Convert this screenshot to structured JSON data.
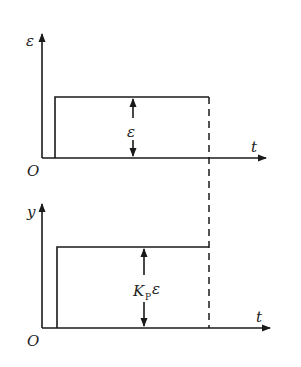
{
  "diagram": {
    "top_plot": {
      "y_axis_label": "ε",
      "x_axis_label": "t",
      "origin_label": "O",
      "amplitude_label": "ε"
    },
    "bottom_plot": {
      "y_axis_label": "y",
      "x_axis_label": "t",
      "origin_label": "O",
      "amplitude_label_main": "K",
      "amplitude_label_sub": "P",
      "amplitude_label_suffix": "ε"
    },
    "colors": {
      "line": "#1a1a1a",
      "background": "#ffffff"
    }
  }
}
